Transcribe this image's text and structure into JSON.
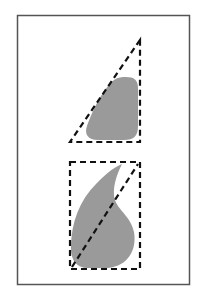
{
  "figure": {
    "colors": {
      "background": "#ffffff",
      "frame": "#555555",
      "shape_fill": "#9a9a9a",
      "dashed_line": "#111111"
    },
    "frame": {
      "x": 17,
      "y": 15,
      "width": 173,
      "height": 270
    },
    "top_panel": {
      "label": "",
      "shape": "rounded-blob",
      "bounding": "right-triangle",
      "triangle_points": [
        [
          140,
          40
        ],
        [
          70,
          142
        ],
        [
          140,
          142
        ]
      ]
    },
    "bottom_panel": {
      "label": "",
      "shape": "teardrop",
      "bounding": "rectangle-with-diagonal",
      "rect": {
        "x": 70,
        "y": 162,
        "width": 70,
        "height": 107
      },
      "diagonal": [
        [
          70,
          269
        ],
        [
          140,
          162
        ]
      ]
    }
  }
}
